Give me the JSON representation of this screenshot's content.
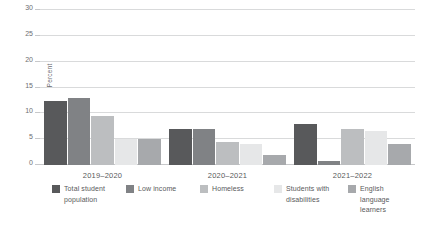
{
  "chart_data": {
    "type": "bar",
    "title": "",
    "subtitle": "",
    "xlabel": "",
    "ylabel": "Percent",
    "ylim": [
      0,
      30
    ],
    "yticks": [
      0,
      5,
      10,
      15,
      20,
      25,
      30
    ],
    "ytick_labels": [
      "0",
      "5",
      "10",
      "15",
      "20",
      "25",
      "30"
    ],
    "grid": true,
    "legend_position": "bottom",
    "categories": [
      "2019–2020",
      "2020–2021",
      "2021–2022"
    ],
    "series": [
      {
        "name": "Total student population",
        "color": "#58595b",
        "values": [
          12.4,
          7.0,
          8.0
        ]
      },
      {
        "name": "Low income",
        "color": "#808285",
        "values": [
          13.0,
          7.0,
          0.8
        ]
      },
      {
        "name": "Homeless",
        "color": "#bcbec0",
        "values": [
          9.5,
          4.5,
          7.0
        ]
      },
      {
        "name": "Students with disabilities",
        "color": "#e6e7e8",
        "values": [
          5.0,
          4.0,
          6.5
        ]
      },
      {
        "name": "English language learners",
        "color": "#a7a9ac",
        "values": [
          5.0,
          2.0,
          4.0
        ]
      }
    ]
  }
}
